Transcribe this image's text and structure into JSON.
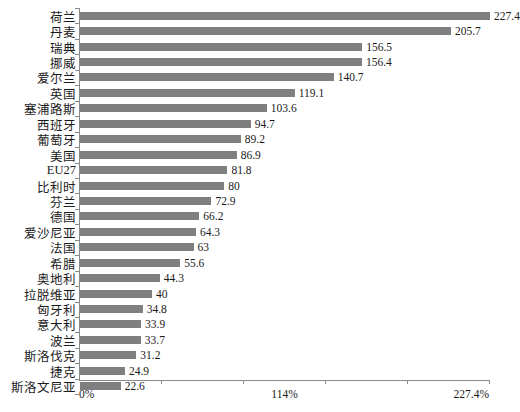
{
  "chart_data": {
    "type": "bar",
    "orientation": "horizontal",
    "title": "",
    "subtitle": "",
    "xlabel": "",
    "ylabel": "",
    "xlim": [
      0,
      227.4
    ],
    "grid": false,
    "legend": null,
    "legend_position": "none",
    "bar_color": "#7f7f7f",
    "axis_color": "#8a8a8a",
    "background_color": "#ffffff",
    "value_labels_shown": true,
    "xtick_labels": [
      "0%",
      "114%",
      "227.4%"
    ],
    "xtick_values": [
      0,
      114,
      227.4
    ],
    "categories": [
      "荷兰",
      "丹麦",
      "瑞典",
      "挪威",
      "爱尔兰",
      "英国",
      "塞浦路斯",
      "西班牙",
      "葡萄牙",
      "美国",
      "EU27",
      "比利时",
      "芬兰",
      "德国",
      "爱沙尼亚",
      "法国",
      "希腊",
      "奥地利",
      "拉脱维亚",
      "匈牙利",
      "意大利",
      "波兰",
      "斯洛伐克",
      "捷克",
      "斯洛文尼亚"
    ],
    "values": [
      227.4,
      205.7,
      156.5,
      156.4,
      140.7,
      119.1,
      103.6,
      94.7,
      89.2,
      86.9,
      81.8,
      80,
      72.9,
      66.2,
      64.3,
      63,
      55.6,
      44.3,
      40,
      34.8,
      33.9,
      33.7,
      31.2,
      24.9,
      22.6
    ],
    "value_labels": [
      "227.4",
      "205.7",
      "156.5",
      "156.4",
      "140.7",
      "119.1",
      "103.6",
      "94.7",
      "89.2",
      "86.9",
      "81.8",
      "80",
      "72.9",
      "66.2",
      "64.3",
      "63",
      "55.6",
      "44.3",
      "40",
      "34.8",
      "33.9",
      "33.7",
      "31.2",
      "24.9",
      "22.6"
    ]
  }
}
